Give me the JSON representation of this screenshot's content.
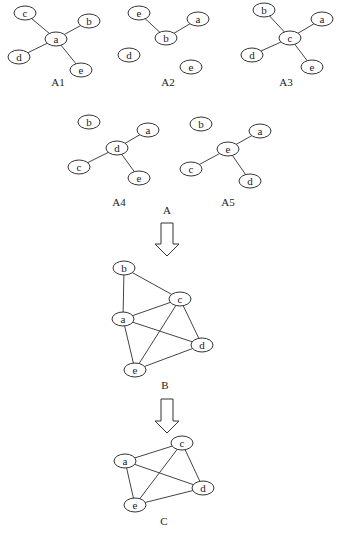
{
  "diagram": {
    "panels": [
      {
        "id": "A1",
        "label": "A1",
        "label_pos": [
          58,
          83
        ],
        "nodes": [
          {
            "id": "c",
            "x": 25,
            "y": 13
          },
          {
            "id": "b",
            "x": 89,
            "y": 21
          },
          {
            "id": "a",
            "x": 56,
            "y": 39
          },
          {
            "id": "d",
            "x": 19,
            "y": 57
          },
          {
            "id": "e",
            "x": 81,
            "y": 70
          }
        ],
        "edges": [
          [
            "c",
            "a"
          ],
          [
            "b",
            "a"
          ],
          [
            "d",
            "a"
          ],
          [
            "e",
            "a"
          ]
        ]
      },
      {
        "id": "A2",
        "label": "A2",
        "label_pos": [
          168,
          83
        ],
        "nodes": [
          {
            "id": "e",
            "x": 139,
            "y": 13
          },
          {
            "id": "a",
            "x": 198,
            "y": 19
          },
          {
            "id": "b",
            "x": 166,
            "y": 38
          },
          {
            "id": "d",
            "x": 129,
            "y": 55
          },
          {
            "id": "e2",
            "text": "e",
            "x": 191,
            "y": 67
          }
        ],
        "edges": [
          [
            "e",
            "b"
          ],
          [
            "a",
            "b"
          ]
        ]
      },
      {
        "id": "A3",
        "label": "A3",
        "label_pos": [
          286,
          83
        ],
        "nodes": [
          {
            "id": "b",
            "x": 264,
            "y": 10
          },
          {
            "id": "a",
            "x": 322,
            "y": 19
          },
          {
            "id": "c",
            "x": 290,
            "y": 38
          },
          {
            "id": "d",
            "x": 252,
            "y": 55
          },
          {
            "id": "e",
            "x": 312,
            "y": 67
          }
        ],
        "edges": [
          [
            "b",
            "c"
          ],
          [
            "a",
            "c"
          ],
          [
            "d",
            "c"
          ],
          [
            "e",
            "c"
          ]
        ]
      },
      {
        "id": "A4",
        "label": "A4",
        "label_pos": [
          119,
          203
        ],
        "nodes": [
          {
            "id": "b",
            "x": 89,
            "y": 122
          },
          {
            "id": "a",
            "x": 148,
            "y": 130
          },
          {
            "id": "d",
            "x": 117,
            "y": 148
          },
          {
            "id": "c",
            "x": 79,
            "y": 167
          },
          {
            "id": "e",
            "x": 139,
            "y": 178
          }
        ],
        "edges": [
          [
            "a",
            "d"
          ],
          [
            "c",
            "d"
          ],
          [
            "e",
            "d"
          ]
        ]
      },
      {
        "id": "A5",
        "label": "A5",
        "label_pos": [
          228,
          203
        ],
        "nodes": [
          {
            "id": "b",
            "x": 201,
            "y": 124
          },
          {
            "id": "a",
            "x": 260,
            "y": 131
          },
          {
            "id": "e",
            "x": 228,
            "y": 149
          },
          {
            "id": "c",
            "x": 191,
            "y": 169
          },
          {
            "id": "d",
            "x": 250,
            "y": 181
          }
        ],
        "edges": [
          [
            "a",
            "e"
          ],
          [
            "c",
            "e"
          ],
          [
            "d",
            "e"
          ]
        ]
      },
      {
        "id": "B",
        "label": "B",
        "label_pos": [
          165,
          386
        ],
        "nodes": [
          {
            "id": "b",
            "x": 124,
            "y": 268
          },
          {
            "id": "c",
            "x": 180,
            "y": 299
          },
          {
            "id": "a",
            "x": 123,
            "y": 319
          },
          {
            "id": "d",
            "x": 202,
            "y": 345
          },
          {
            "id": "e",
            "x": 135,
            "y": 370
          }
        ],
        "edges": [
          [
            "b",
            "a"
          ],
          [
            "b",
            "c"
          ],
          [
            "a",
            "c"
          ],
          [
            "a",
            "d"
          ],
          [
            "a",
            "e"
          ],
          [
            "c",
            "e"
          ],
          [
            "c",
            "d"
          ],
          [
            "e",
            "d"
          ]
        ]
      },
      {
        "id": "C",
        "label": "C",
        "label_pos": [
          164,
          522
        ],
        "nodes": [
          {
            "id": "c",
            "x": 182,
            "y": 443
          },
          {
            "id": "a",
            "x": 125,
            "y": 461
          },
          {
            "id": "d",
            "x": 203,
            "y": 488
          },
          {
            "id": "e",
            "x": 135,
            "y": 505
          }
        ],
        "edges": [
          [
            "a",
            "c"
          ],
          [
            "a",
            "d"
          ],
          [
            "a",
            "e"
          ],
          [
            "c",
            "e"
          ],
          [
            "c",
            "d"
          ],
          [
            "e",
            "d"
          ]
        ]
      }
    ],
    "group_label": {
      "text": "A",
      "pos": [
        167,
        211
      ]
    },
    "arrows": [
      {
        "x": 167,
        "y1": 223,
        "y2": 256
      },
      {
        "x": 167,
        "y1": 399,
        "y2": 433
      }
    ],
    "colors": {
      "stroke": "#333333",
      "background": "#ffffff",
      "text": "#222222"
    }
  }
}
